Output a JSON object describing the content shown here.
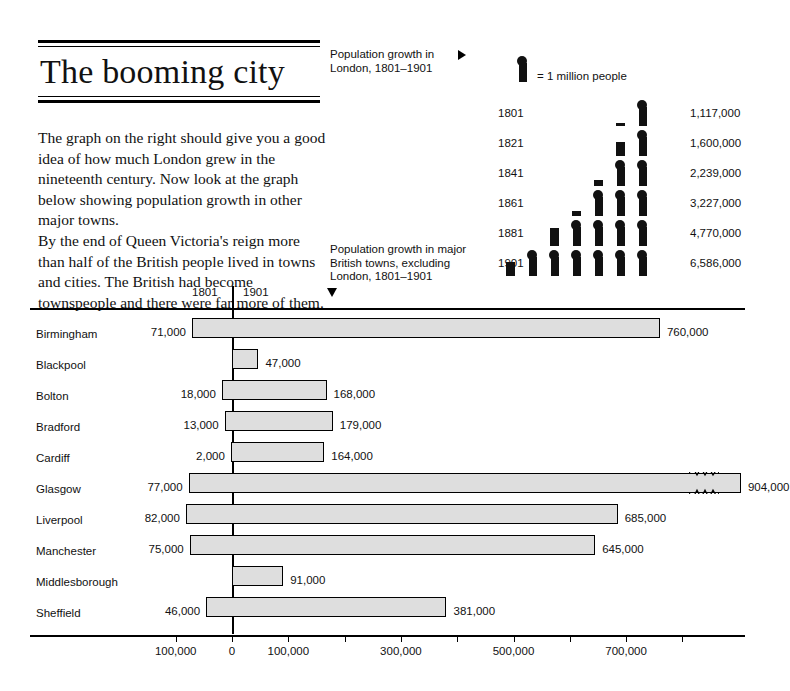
{
  "headline": "The booming city",
  "intro": {
    "paragraph_1": "The graph on the right should give you a good idea of how much London grew in the nineteenth century. Now look at the graph below showing population growth in other major towns.",
    "paragraph_2": "By the end of Queen Victoria's reign more than half of the British people lived in towns and cities. The British had become townspeople and there were far more of them."
  },
  "captions": {
    "london": "Population growth in London, 1801–1901",
    "towns": "Population growth in major British towns, excluding London, 1801–1901"
  },
  "legend": {
    "text": "= 1 million people",
    "unit_value": 1000000
  },
  "chart_data": [
    {
      "type": "bar",
      "id": "london-pictogram",
      "title": "Population growth in London, 1801–1901",
      "units": "people",
      "unit_per_icon": 1000000,
      "icon": "person-figure",
      "legend": "= 1 million people",
      "xlabel": "",
      "ylabel": "Year",
      "categories": [
        "1801",
        "1821",
        "1841",
        "1861",
        "1881",
        "1901"
      ],
      "values": [
        1117000,
        1600000,
        2239000,
        3227000,
        4770000,
        6586000
      ],
      "value_labels": [
        "1,117,000",
        "1,600,000",
        "2,239,000",
        "3,227,000",
        "4,770,000",
        "6,586,000"
      ],
      "rows": [
        {
          "year": "1801",
          "value": 1117000,
          "label": "1,117,000",
          "full_icons": 1,
          "partial_fraction": 0.117
        },
        {
          "year": "1821",
          "value": 1600000,
          "label": "1,600,000",
          "full_icons": 1,
          "partial_fraction": 0.6
        },
        {
          "year": "1841",
          "value": 2239000,
          "label": "2,239,000",
          "full_icons": 2,
          "partial_fraction": 0.239
        },
        {
          "year": "1861",
          "value": 3227000,
          "label": "3,227,000",
          "full_icons": 3,
          "partial_fraction": 0.227
        },
        {
          "year": "1881",
          "value": 4770000,
          "label": "4,770,000",
          "full_icons": 4,
          "partial_fraction": 0.77
        },
        {
          "year": "1901",
          "value": 6586000,
          "label": "6,586,000",
          "full_icons": 6,
          "partial_fraction": 0.586
        }
      ]
    },
    {
      "type": "bar",
      "id": "towns-bar-chart",
      "title": "Population growth in major British towns, excluding London, 1801–1901",
      "orientation": "horizontal",
      "xlabel": "",
      "ylabel": "",
      "grid": false,
      "axis_header_left": "1801",
      "axis_header_right": "1901",
      "xlim": [
        -100000,
        800000
      ],
      "xticks": [
        -100000,
        0,
        100000,
        200000,
        300000,
        400000,
        500000,
        600000,
        700000,
        800000
      ],
      "xtick_labels": [
        "100,000",
        "0",
        "100,000",
        "",
        "300,000",
        "",
        "500,000",
        "",
        "700,000",
        ""
      ],
      "categories": [
        "Birmingham",
        "Blackpool",
        "Bolton",
        "Bradford",
        "Cardiff",
        "Glasgow",
        "Liverpool",
        "Manchester",
        "Middlesborough",
        "Sheffield"
      ],
      "series": [
        {
          "name": "1801",
          "values": [
            71000,
            null,
            18000,
            13000,
            2000,
            77000,
            82000,
            75000,
            null,
            46000
          ]
        },
        {
          "name": "1901",
          "values": [
            760000,
            47000,
            168000,
            179000,
            164000,
            904000,
            685000,
            645000,
            91000,
            381000
          ]
        }
      ],
      "rows": [
        {
          "name": "Birmingham",
          "start_value": 71000,
          "start_label": "71,000",
          "end_value": 760000,
          "end_label": "760,000",
          "scale_break": false
        },
        {
          "name": "Blackpool",
          "start_value": 0,
          "start_label": "",
          "end_value": 47000,
          "end_label": "47,000",
          "scale_break": false
        },
        {
          "name": "Bolton",
          "start_value": 18000,
          "start_label": "18,000",
          "end_value": 168000,
          "end_label": "168,000",
          "scale_break": false
        },
        {
          "name": "Bradford",
          "start_value": 13000,
          "start_label": "13,000",
          "end_value": 179000,
          "end_label": "179,000",
          "scale_break": false
        },
        {
          "name": "Cardiff",
          "start_value": 2000,
          "start_label": "2,000",
          "end_value": 164000,
          "end_label": "164,000",
          "scale_break": false
        },
        {
          "name": "Glasgow",
          "start_value": 77000,
          "start_label": "77,000",
          "end_value": 904000,
          "end_label": "904,000",
          "scale_break": true
        },
        {
          "name": "Liverpool",
          "start_value": 82000,
          "start_label": "82,000",
          "end_value": 685000,
          "end_label": "685,000",
          "scale_break": false
        },
        {
          "name": "Manchester",
          "start_value": 75000,
          "start_label": "75,000",
          "end_value": 645000,
          "end_label": "645,000",
          "scale_break": false
        },
        {
          "name": "Middlesborough",
          "start_value": 0,
          "start_label": "",
          "end_value": 91000,
          "end_label": "91,000",
          "scale_break": false
        },
        {
          "name": "Sheffield",
          "start_value": 46000,
          "start_label": "46,000",
          "end_value": 381000,
          "end_label": "381,000",
          "scale_break": false
        }
      ]
    }
  ]
}
